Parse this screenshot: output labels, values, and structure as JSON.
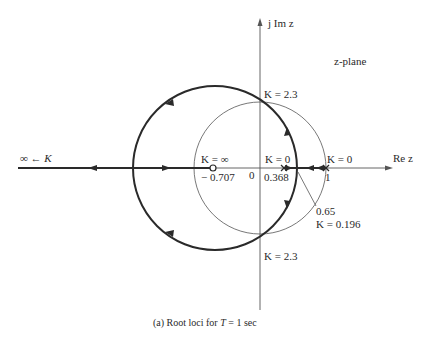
{
  "figure": {
    "plane_label": "z-plane",
    "imag_axis_label": "j Im z",
    "real_axis_label": "Re z",
    "caption": "(a) Root loci for T = 1 sec",
    "caption_prefix": "(a) Root loci for ",
    "caption_var": "T",
    "caption_suffix": " = 1 sec",
    "origin_label": "0",
    "zero": {
      "value": -0.707,
      "label": "K = ∞",
      "tick_label": "− 0.707"
    },
    "pole_1": {
      "value": 0.368,
      "label": "K = 0",
      "tick_label": "0.368"
    },
    "pole_2": {
      "value": 1,
      "label": "K = 0",
      "tick_label": "1"
    },
    "breakaway": {
      "value": 0.65,
      "label_value": "0.65",
      "label_gain": "K = 0.196"
    },
    "crossing_upper": {
      "label": "K = 2.3"
    },
    "crossing_lower": {
      "label": "K = 2.3"
    },
    "asymptote_label": "∞ ← K",
    "unit_circle": {
      "radius": 1
    },
    "locus_circle": {
      "center": -0.707,
      "radius": 1.357
    },
    "colors": {
      "ink": "#2a2a2a",
      "axis": "#555555",
      "background": "#ffffff"
    }
  }
}
